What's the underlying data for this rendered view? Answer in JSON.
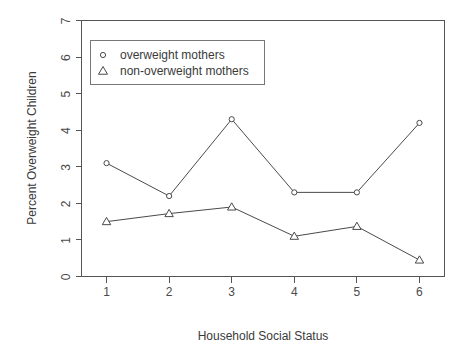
{
  "chart_data": {
    "type": "line",
    "title": "",
    "xlabel": "Household Social Status",
    "ylabel": "Percent Overweight Children",
    "categories": [
      1,
      2,
      3,
      4,
      5,
      6
    ],
    "x": [
      1,
      2,
      3,
      4,
      5,
      6
    ],
    "xtick_labels": [
      "1",
      "2",
      "3",
      "4",
      "5",
      "6"
    ],
    "ytick_labels": [
      "0",
      "1",
      "2",
      "3",
      "4",
      "5",
      "6",
      "7"
    ],
    "yticks": [
      0,
      1,
      2,
      3,
      4,
      5,
      6,
      7
    ],
    "xlim": [
      0.6,
      6.4
    ],
    "ylim": [
      0,
      7
    ],
    "grid": false,
    "legend_position": "top-left",
    "series": [
      {
        "name": "overweight mothers",
        "marker": "circle",
        "values": [
          3.1,
          2.2,
          4.3,
          2.3,
          2.3,
          4.2
        ]
      },
      {
        "name": "non-overweight mothers",
        "marker": "triangle",
        "values": [
          1.5,
          1.72,
          1.9,
          1.1,
          1.37,
          0.45
        ]
      }
    ]
  },
  "legend": {
    "entries": [
      {
        "label": "overweight mothers",
        "marker": "circle-marker-icon"
      },
      {
        "label": "non-overweight mothers",
        "marker": "triangle-marker-icon"
      }
    ]
  },
  "colors": {
    "line": "#4a4a4a",
    "axis": "#555555",
    "text": "#3a3a3a",
    "background": "#ffffff",
    "legend_border": "#777777"
  }
}
